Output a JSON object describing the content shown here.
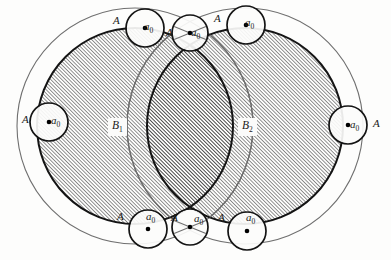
{
  "figure": {
    "name": "overlapping-discs-diagram",
    "background_color": "#fdfdfc",
    "width": 391,
    "height": 260
  },
  "colors": {
    "outer_circle_stroke": "#6f6f6f",
    "disc_stroke": "#141414",
    "small_circle_stroke": "#141414",
    "hatch_stroke": "#2a2a2a",
    "label_color": "#1a1a1a",
    "label_box_fill": "#fbfbfa",
    "dot_fill": "#000000"
  },
  "discs": [
    {
      "id": "B1",
      "label": "B",
      "subscript": "1",
      "cx": 135,
      "cy": 126,
      "r": 98,
      "label_x": 108,
      "label_y": 118
    },
    {
      "id": "B2",
      "label": "B",
      "subscript": "2",
      "cx": 245,
      "cy": 126,
      "r": 98,
      "label_x": 238,
      "label_y": 118
    }
  ],
  "outer_circles": [
    {
      "id": "outer-left",
      "cx": 135,
      "cy": 126,
      "r": 118
    },
    {
      "id": "outer-right",
      "cx": 245,
      "cy": 126,
      "r": 118
    }
  ],
  "small_circles": [
    {
      "id": "top-left",
      "cx": 145,
      "cy": 28,
      "r": 19,
      "a_label": "a",
      "a_sub": "0",
      "A_label": "A",
      "a_x": 144,
      "a_y": 21,
      "A_x": 113,
      "A_y": 15,
      "has_dot": true,
      "cross": false
    },
    {
      "id": "top-center",
      "cx": 190,
      "cy": 33,
      "r": 18,
      "a_label": "a",
      "a_sub": "0",
      "A_label": "A",
      "a_x": 191,
      "a_y": 27,
      "A_x": 166,
      "A_y": 27,
      "has_dot": true,
      "cross": true
    },
    {
      "id": "top-right",
      "cx": 246,
      "cy": 25,
      "r": 19,
      "a_label": "a",
      "a_sub": "0",
      "A_label": "A",
      "a_x": 245,
      "a_y": 17,
      "A_x": 214,
      "A_y": 13,
      "has_dot": true,
      "cross": false
    },
    {
      "id": "left-side",
      "cx": 49,
      "cy": 122,
      "r": 19,
      "a_label": "a",
      "a_sub": "0",
      "A_label": "A",
      "a_x": 51,
      "a_y": 115,
      "A_x": 22,
      "A_y": 114,
      "has_dot": true,
      "cross": false
    },
    {
      "id": "right-side",
      "cx": 348,
      "cy": 125,
      "r": 19,
      "a_label": "a",
      "a_sub": "0",
      "A_label": "A",
      "a_x": 350,
      "a_y": 119,
      "A_x": 373,
      "A_y": 118,
      "has_dot": true,
      "cross": false
    },
    {
      "id": "bottom-left",
      "cx": 148,
      "cy": 229,
      "r": 19,
      "a_label": "a",
      "a_sub": "0",
      "A_label": "A",
      "a_x": 146,
      "a_y": 211,
      "A_x": 117,
      "A_y": 211,
      "has_dot": true,
      "cross": false
    },
    {
      "id": "bottom-center",
      "cx": 190,
      "cy": 227,
      "r": 18,
      "a_label": "a",
      "a_sub": "0",
      "A_label": "A",
      "a_x": 194,
      "a_y": 213,
      "A_x": 171,
      "A_y": 212,
      "has_dot": true,
      "cross": true
    },
    {
      "id": "bottom-right",
      "cx": 247,
      "cy": 231,
      "r": 19,
      "a_label": "a",
      "a_sub": "0",
      "A_label": "A",
      "a_x": 246,
      "a_y": 212,
      "A_x": 218,
      "A_y": 212,
      "has_dot": true,
      "cross": false
    }
  ],
  "hatching": {
    "direction": "diagonal-up-right",
    "spacing_px": 2.6,
    "stroke_width": 1.0
  }
}
